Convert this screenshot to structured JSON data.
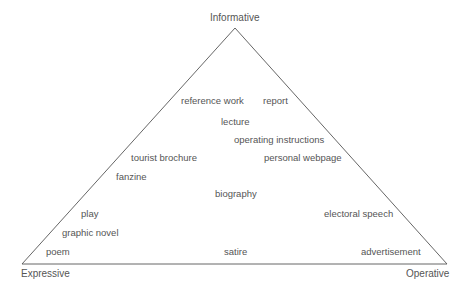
{
  "diagram": {
    "type": "triangle",
    "vertices": {
      "top": "Informative",
      "bottom_left": "Expressive",
      "bottom_right": "Operative"
    },
    "items": [
      {
        "label": "reference work",
        "x": 181,
        "y": 95
      },
      {
        "label": "report",
        "x": 263,
        "y": 95
      },
      {
        "label": "lecture",
        "x": 221,
        "y": 116
      },
      {
        "label": "operating instructions",
        "x": 234,
        "y": 134
      },
      {
        "label": "tourist brochure",
        "x": 131,
        "y": 152
      },
      {
        "label": "personal webpage",
        "x": 264,
        "y": 152
      },
      {
        "label": "fanzine",
        "x": 116,
        "y": 171
      },
      {
        "label": "biography",
        "x": 215,
        "y": 188
      },
      {
        "label": "play",
        "x": 81,
        "y": 208
      },
      {
        "label": "electoral speech",
        "x": 324,
        "y": 208
      },
      {
        "label": "graphic novel",
        "x": 62,
        "y": 227
      },
      {
        "label": "poem",
        "x": 46,
        "y": 246
      },
      {
        "label": "satire",
        "x": 224,
        "y": 246
      },
      {
        "label": "advertisement",
        "x": 361,
        "y": 246
      }
    ],
    "line_color": "#555555",
    "text_color": "#555555"
  }
}
